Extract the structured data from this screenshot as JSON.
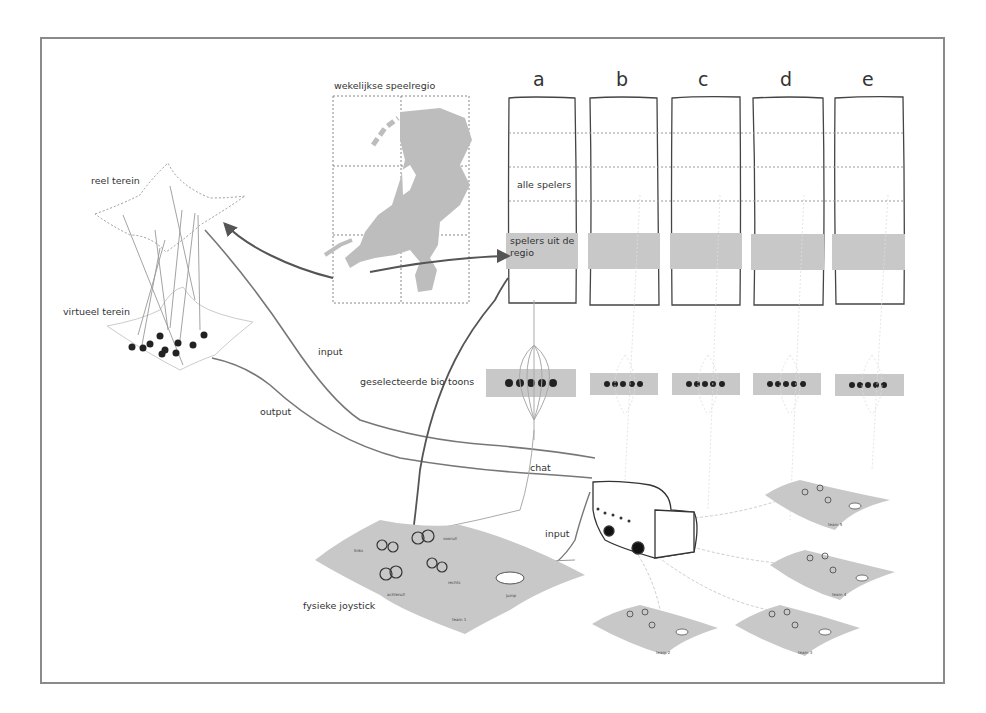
{
  "diagram": {
    "labels": {
      "weekly_region": "wekelijkse speelregio",
      "real_terrain": "reel terein",
      "virtual_terrain": "virtueel terein",
      "all_players": "alle spelers",
      "players_region": "spelers uit de regio",
      "selected_biotoons": "geselecteerde bio toons",
      "input_top": "input",
      "output": "output",
      "chat": "chat",
      "input_bottom": "input",
      "physical_joystick": "fysieke joystick"
    },
    "columns": [
      {
        "id": "a",
        "label": "a"
      },
      {
        "id": "b",
        "label": "b"
      },
      {
        "id": "c",
        "label": "c"
      },
      {
        "id": "d",
        "label": "d"
      },
      {
        "id": "e",
        "label": "e"
      }
    ],
    "main_field": {
      "team": "team 1",
      "controls": [
        "links",
        "vooruit",
        "rechts",
        "achteruit"
      ],
      "jump": "jump"
    },
    "other_fields": [
      {
        "team": "team 2"
      },
      {
        "team": "team 3"
      },
      {
        "team": "team 4"
      },
      {
        "team": "team 5"
      }
    ],
    "colors": {
      "frame": "#8a8a8a",
      "ink": "#333333",
      "fill_gray": "#c8c8c8",
      "map_gray": "#bdbdbd",
      "faint_line": "#cfcfcf"
    }
  }
}
